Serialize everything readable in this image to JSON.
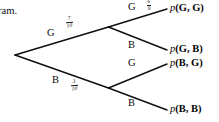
{
  "diagram": {
    "kind": "probability-tree-diagram",
    "leading_text_fragment": "ram.",
    "root_label": "",
    "level1": [
      {
        "id": "branch-g",
        "letter": "G",
        "probability_numerator": "7",
        "probability_denominator": "10",
        "probability": "7/10"
      },
      {
        "id": "branch-b",
        "letter": "B",
        "probability_numerator": "3",
        "probability_denominator": "10",
        "probability": "3/10"
      }
    ],
    "level2": [
      {
        "id": "branch-gg",
        "letter": "G",
        "probability_numerator": "6",
        "probability_denominator": "9",
        "probability": "6/9",
        "outcome_prefix": "p",
        "outcome": "(G, G)"
      },
      {
        "id": "branch-gb",
        "letter": "B",
        "probability_numerator": "",
        "probability_denominator": "",
        "probability": "",
        "outcome_prefix": "p",
        "outcome": "(G, B)"
      },
      {
        "id": "branch-bg",
        "letter": "G",
        "probability_numerator": "",
        "probability_denominator": "",
        "probability": "",
        "outcome_prefix": "p",
        "outcome": "(B, G)"
      },
      {
        "id": "branch-bb",
        "letter": "B",
        "probability_numerator": "",
        "probability_denominator": "",
        "probability": "",
        "outcome_prefix": "p",
        "outcome": "(B, B)"
      }
    ],
    "colors": {
      "background": "#ffffff",
      "ink": "#0b0b0b",
      "line": "#101010"
    }
  }
}
